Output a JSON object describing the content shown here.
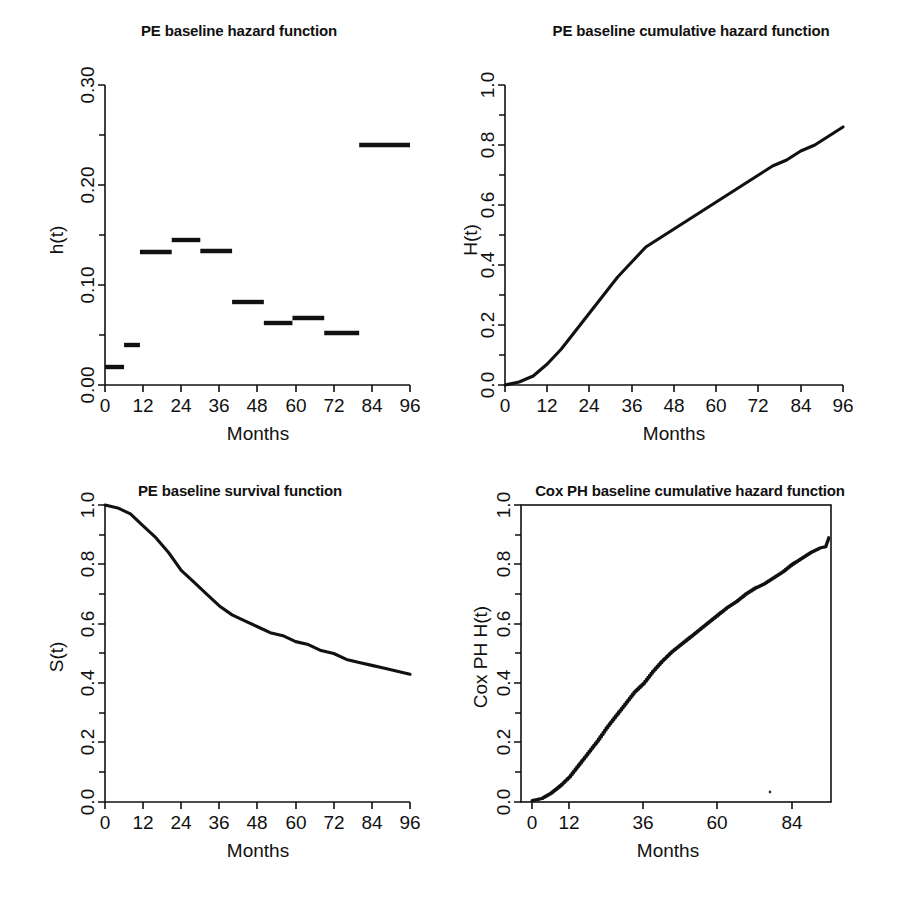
{
  "figure": {
    "background": "#ffffff",
    "ink": "#111111",
    "panel_count": 4
  },
  "panels": [
    {
      "id": "pe-baseline-hazard",
      "title": "PE baseline hazard function",
      "xlabel": "Months",
      "ylabel": "h(t)"
    },
    {
      "id": "pe-baseline-cumulative-hazard",
      "title": "PE baseline cumulative hazard function",
      "xlabel": "Months",
      "ylabel": "H(t)"
    },
    {
      "id": "pe-baseline-survival",
      "title": "PE baseline survival function",
      "xlabel": "Months",
      "ylabel": "S(t)"
    },
    {
      "id": "cox-ph-baseline-cumulative-hazard",
      "title": "Cox PH baseline cumulative hazard function",
      "xlabel": "Months",
      "ylabel": "Cox PH H(t)"
    }
  ],
  "chart_data": [
    {
      "type": "line",
      "id": "pe-baseline-hazard",
      "title": "PE baseline hazard function",
      "xlabel": "Months",
      "ylabel": "h(t)",
      "xlim": [
        0,
        96
      ],
      "ylim": [
        0,
        0.3
      ],
      "xticks": [
        0,
        12,
        24,
        36,
        48,
        60,
        72,
        84,
        96
      ],
      "xticklabels": [
        "0",
        "12",
        "24",
        "36",
        "48",
        "60",
        "72",
        "84",
        "96"
      ],
      "yticks": [
        0.0,
        0.1,
        0.2,
        0.3
      ],
      "yticklabels": [
        "0.00",
        "0.10",
        "0.20",
        "0.30"
      ],
      "yminorticks": [
        0.05,
        0.15,
        0.25
      ],
      "grid": false,
      "legend": null,
      "style": "piecewise-constant step segments (no vertical connectors)",
      "intervals": [
        {
          "start": 0,
          "end": 6,
          "value": 0.018
        },
        {
          "start": 6,
          "end": 11,
          "value": 0.04
        },
        {
          "start": 11,
          "end": 21,
          "value": 0.133
        },
        {
          "start": 21,
          "end": 30,
          "value": 0.145
        },
        {
          "start": 30,
          "end": 40,
          "value": 0.134
        },
        {
          "start": 40,
          "end": 50,
          "value": 0.083
        },
        {
          "start": 50,
          "end": 59,
          "value": 0.062
        },
        {
          "start": 59,
          "end": 69,
          "value": 0.067
        },
        {
          "start": 69,
          "end": 80,
          "value": 0.052
        },
        {
          "start": 80,
          "end": 96,
          "value": 0.24
        }
      ]
    },
    {
      "type": "line",
      "id": "pe-baseline-cumulative-hazard",
      "title": "PE baseline cumulative hazard function",
      "xlabel": "Months",
      "ylabel": "H(t)",
      "xlim": [
        0,
        96
      ],
      "ylim": [
        0,
        1.0
      ],
      "xticks": [
        0,
        12,
        24,
        36,
        48,
        60,
        72,
        84,
        96
      ],
      "xticklabels": [
        "0",
        "12",
        "24",
        "36",
        "48",
        "60",
        "72",
        "84",
        "96"
      ],
      "yticks": [
        0.0,
        0.2,
        0.4,
        0.6,
        0.8,
        1.0
      ],
      "yticklabels": [
        "0.0",
        "0.2",
        "0.4",
        "0.6",
        "0.8",
        "1.0"
      ],
      "yminorticks": [
        0.1,
        0.3,
        0.5,
        0.7,
        0.9
      ],
      "grid": false,
      "legend": null,
      "x": [
        0,
        4,
        8,
        12,
        16,
        20,
        24,
        28,
        32,
        36,
        40,
        44,
        48,
        52,
        56,
        60,
        64,
        68,
        72,
        76,
        80,
        84,
        88,
        92,
        96
      ],
      "y": [
        0.0,
        0.01,
        0.03,
        0.07,
        0.12,
        0.18,
        0.24,
        0.3,
        0.36,
        0.41,
        0.46,
        0.49,
        0.52,
        0.55,
        0.58,
        0.61,
        0.64,
        0.67,
        0.7,
        0.73,
        0.75,
        0.78,
        0.8,
        0.83,
        0.86
      ]
    },
    {
      "type": "line",
      "id": "pe-baseline-survival",
      "title": "PE baseline survival function",
      "xlabel": "Months",
      "ylabel": "S(t)",
      "xlim": [
        0,
        96
      ],
      "ylim": [
        0,
        1.0
      ],
      "xticks": [
        0,
        12,
        24,
        36,
        48,
        60,
        72,
        84,
        96
      ],
      "xticklabels": [
        "0",
        "12",
        "24",
        "36",
        "48",
        "60",
        "72",
        "84",
        "96"
      ],
      "yticks": [
        0.0,
        0.2,
        0.4,
        0.6,
        0.8,
        1.0
      ],
      "yticklabels": [
        "0.0",
        "0.2",
        "0.4",
        "0.6",
        "0.8",
        "1.0"
      ],
      "yminorticks": [
        0.1,
        0.3,
        0.5,
        0.7,
        0.9
      ],
      "grid": false,
      "legend": null,
      "x": [
        0,
        4,
        8,
        12,
        16,
        20,
        24,
        28,
        32,
        36,
        40,
        44,
        48,
        52,
        56,
        60,
        64,
        68,
        72,
        76,
        80,
        84,
        88,
        92,
        96
      ],
      "y": [
        1.0,
        0.99,
        0.97,
        0.93,
        0.89,
        0.84,
        0.78,
        0.74,
        0.7,
        0.66,
        0.63,
        0.61,
        0.59,
        0.57,
        0.56,
        0.54,
        0.53,
        0.51,
        0.5,
        0.48,
        0.47,
        0.46,
        0.45,
        0.44,
        0.43
      ]
    },
    {
      "type": "line",
      "id": "cox-ph-baseline-cumulative-hazard",
      "title": "Cox PH baseline cumulative hazard function",
      "xlabel": "Months",
      "ylabel": "Cox PH H(t)",
      "xlim": [
        0,
        100
      ],
      "ylim": [
        0,
        1.0
      ],
      "xticks": [
        0,
        12,
        36,
        60,
        84
      ],
      "xticklabels": [
        "0",
        "12",
        "36",
        "60",
        "84"
      ],
      "yticks": [
        0.0,
        0.2,
        0.4,
        0.6,
        0.8,
        1.0
      ],
      "yticklabels": [
        "0.0",
        "0.2",
        "0.4",
        "0.6",
        "0.8",
        "1.0"
      ],
      "yminorticks": [
        0.1,
        0.3,
        0.5,
        0.7,
        0.9
      ],
      "grid": false,
      "legend": null,
      "frame": "full-box",
      "style": "Breslow step estimator (small stair steps)",
      "x": [
        0,
        3,
        6,
        9,
        12,
        15,
        18,
        21,
        24,
        27,
        30,
        33,
        36,
        39,
        42,
        45,
        48,
        51,
        54,
        57,
        60,
        63,
        66,
        69,
        72,
        75,
        78,
        81,
        84,
        87,
        90,
        93,
        95,
        96
      ],
      "y": [
        0.005,
        0.012,
        0.03,
        0.055,
        0.085,
        0.125,
        0.165,
        0.205,
        0.25,
        0.29,
        0.33,
        0.37,
        0.4,
        0.44,
        0.475,
        0.505,
        0.53,
        0.555,
        0.58,
        0.605,
        0.63,
        0.655,
        0.675,
        0.7,
        0.72,
        0.735,
        0.755,
        0.775,
        0.8,
        0.82,
        0.84,
        0.855,
        0.86,
        0.89
      ]
    }
  ]
}
